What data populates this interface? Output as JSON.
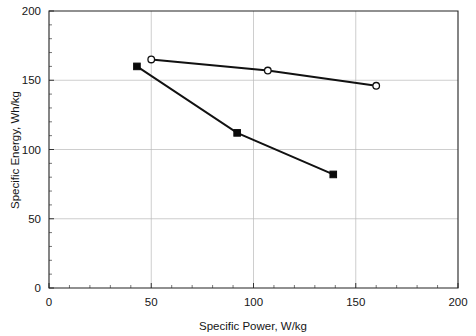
{
  "chart_data": {
    "type": "line",
    "title": "",
    "xlabel": "Specific Power, W/kg",
    "ylabel": "Specific Energy, Wh/kg",
    "xlim": [
      0,
      200
    ],
    "ylim": [
      0,
      200
    ],
    "xticks": [
      0,
      50,
      100,
      150,
      200
    ],
    "yticks": [
      0,
      50,
      100,
      150,
      200
    ],
    "xtick_labels": [
      "0",
      "50",
      "100",
      "150",
      "200"
    ],
    "ytick_labels": [
      "0",
      "50",
      "100",
      "150",
      "200"
    ],
    "grid": true,
    "legend": "none",
    "series": [
      {
        "name": "open-circle-series",
        "marker": "open-circle",
        "x": [
          50,
          107,
          160
        ],
        "y": [
          165,
          157,
          146
        ]
      },
      {
        "name": "filled-square-series",
        "marker": "filled-square",
        "x": [
          43,
          92,
          139
        ],
        "y": [
          160,
          112,
          82
        ]
      }
    ]
  },
  "axes": {
    "x_title": "Specific Power, W/kg",
    "y_title": "Specific Energy, Wh/kg",
    "x_tick_labels": [
      "0",
      "50",
      "100",
      "150",
      "200"
    ],
    "y_tick_labels": [
      "0",
      "50",
      "100",
      "150",
      "200"
    ]
  },
  "colors": {
    "line": "#111111",
    "grid": "#b9b9b9",
    "axis": "#222222",
    "marker_open_fill": "#ffffff",
    "marker_filled": "#0b0b0b",
    "background": "#ffffff"
  }
}
